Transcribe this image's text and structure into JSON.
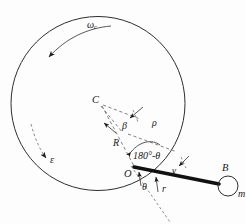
{
  "figure": {
    "kind": "engineering-kinematics-diagram",
    "background_color": "#fdfdfd",
    "ink_color": "#1a1a1a"
  },
  "labels": {
    "omega_c": "ωc",
    "omega_c_plain": "ω",
    "omega_c_sub": "c",
    "epsilon": "ε",
    "center_c": "C",
    "beta": "β",
    "rho": "ρ",
    "radius_r_big": "R",
    "angle_180_minus_theta": "180°-θ",
    "origin_o": "O",
    "theta": "θ",
    "gamma": "γ",
    "radius_r_small": "r",
    "point_b": "B",
    "mass_m": "m"
  },
  "geometry": {
    "big_circle": {
      "cx": 98,
      "cy": 103.5,
      "r": 87
    },
    "mass_circle": {
      "cx": 228,
      "cy": 186,
      "r": 10
    },
    "point_C": {
      "x": 100,
      "y": 104
    },
    "point_O": {
      "x": 134,
      "y": 167
    },
    "point_B": {
      "x": 219,
      "y": 184
    },
    "rod_label": "O-B"
  },
  "annotations": {
    "omega_arrow": "counter-clockwise angular velocity arc at top of circle",
    "epsilon_arrow": "angular acceleration arc at lower-left of circle",
    "dimension_beta": "angle between R and rho at vertex near C",
    "dimension_theta": "angle at O below rod",
    "dimension_gamma": "angle at rod between rho direction and rod"
  }
}
